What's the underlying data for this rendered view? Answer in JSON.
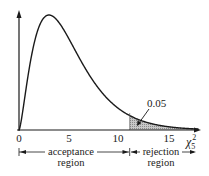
{
  "chart_data": {
    "type": "area",
    "title": "",
    "distribution": "chi-square",
    "degrees_of_freedom": 5,
    "xlabel": "χ5²",
    "ylabel": "",
    "xlim": [
      0,
      18
    ],
    "x_ticks": [
      0,
      5,
      10,
      15
    ],
    "x_tick_labels": [
      "0",
      "5",
      "10",
      "15"
    ],
    "critical_value": 11.07,
    "shaded_area": 0.05,
    "annotations": [
      {
        "text": "0.05",
        "points_to": "shaded tail area right of critical value"
      }
    ],
    "regions": [
      {
        "name": "acceptance region",
        "from": 0,
        "to": 11.07
      },
      {
        "name": "rejection region",
        "from": 11.07,
        "to": 18
      }
    ],
    "peak": {
      "x": 3,
      "y": 0.154
    },
    "grid": false,
    "legend": "none"
  },
  "labels": {
    "tick0": "0",
    "tick5": "5",
    "tick10": "10",
    "tick15": "15",
    "axis_chi": "χ",
    "axis_sub": "5",
    "axis_sup": "2",
    "annotation": "0.05",
    "acceptance_line1": "acceptance",
    "acceptance_line2": "region",
    "rejection_line1": "rejection",
    "rejection_line2": "region"
  },
  "colors": {
    "line": "#1a1a1a",
    "shade": "#b5b5b5"
  }
}
